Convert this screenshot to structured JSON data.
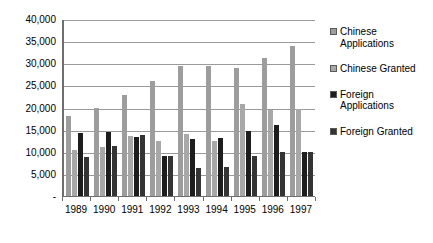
{
  "chart_data": {
    "type": "bar",
    "title": "",
    "subtitle": "",
    "xlabel": "",
    "ylabel": "",
    "ylim": [
      0,
      40000
    ],
    "grid": true,
    "legend_position": "right",
    "categories": [
      "1989",
      "1990",
      "1991",
      "1992",
      "1993",
      "1994",
      "1995",
      "1996",
      "1997"
    ],
    "ytick_labels": [
      "40,000",
      "35,000",
      "30,000",
      "25,000",
      "20,000",
      "15,000",
      "10,000",
      "5,000",
      "-"
    ],
    "ytick_values": [
      40000,
      35000,
      30000,
      25000,
      20000,
      15000,
      10000,
      5000,
      0
    ],
    "series": [
      {
        "name": "Chinese Applications",
        "color": "#9d9d9d",
        "values": [
          18000,
          20000,
          22900,
          26100,
          29400,
          29400,
          29000,
          31300,
          34000
        ]
      },
      {
        "name": "Chinese Granted",
        "color": "#a8a8a8",
        "values": [
          10400,
          11000,
          13600,
          12400,
          14100,
          12500,
          20700,
          19500,
          19600
        ]
      },
      {
        "name": "Foreign Applications",
        "color": "#1d1d1d",
        "values": [
          14200,
          14500,
          13300,
          9000,
          12800,
          13100,
          14600,
          16000,
          9900
        ]
      },
      {
        "name": "Foreign Granted",
        "color": "#343434",
        "values": [
          8900,
          11400,
          13800,
          9000,
          6300,
          6500,
          9000,
          10000,
          9900
        ]
      }
    ]
  },
  "legend": {
    "items": [
      {
        "label": "Chinese Applications",
        "swatch": "chinese-applications-swatch"
      },
      {
        "label": "Chinese Granted",
        "swatch": "chinese-granted-swatch"
      },
      {
        "label": "Foreign Applications",
        "swatch": "foreign-applications-swatch"
      },
      {
        "label": "Foreign Granted",
        "swatch": "foreign-granted-swatch"
      }
    ]
  }
}
